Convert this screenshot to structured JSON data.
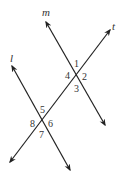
{
  "diagram": {
    "lines": [
      {
        "name": "m",
        "x1": 46,
        "y1": 22,
        "x2": 105,
        "y2": 125,
        "label_x": 42,
        "label_y": 16
      },
      {
        "name": "t",
        "x1": 110,
        "y1": 30,
        "x2": 10,
        "y2": 162,
        "label_x": 112,
        "label_y": 30
      },
      {
        "name": "l",
        "x1": 12,
        "y1": 66,
        "x2": 70,
        "y2": 170,
        "label_x": 10,
        "label_y": 62
      }
    ],
    "angles": [
      {
        "label": "1",
        "x": 74,
        "y": 67
      },
      {
        "label": "2",
        "x": 82,
        "y": 80
      },
      {
        "label": "3",
        "x": 74,
        "y": 92
      },
      {
        "label": "4",
        "x": 65,
        "y": 79
      },
      {
        "label": "5",
        "x": 40,
        "y": 113
      },
      {
        "label": "6",
        "x": 48,
        "y": 127
      },
      {
        "label": "7",
        "x": 39,
        "y": 138
      },
      {
        "label": "8",
        "x": 30,
        "y": 127
      }
    ],
    "stroke_color": "#222222"
  }
}
